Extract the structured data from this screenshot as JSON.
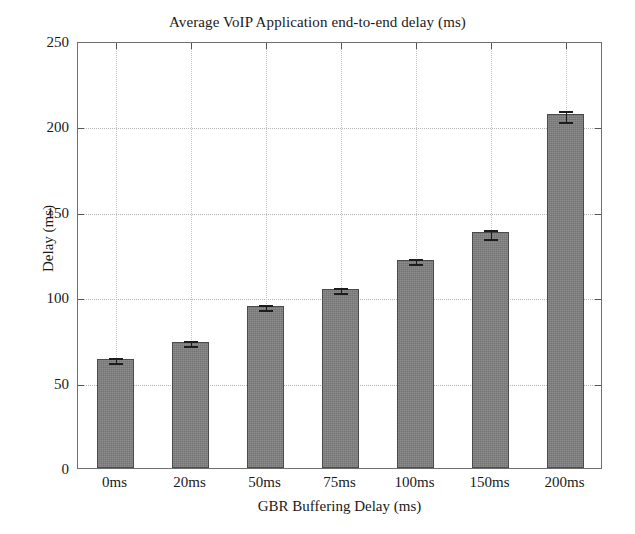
{
  "chart_data": {
    "type": "bar",
    "title": "Average VoIP Application end-to-end delay (ms)",
    "xlabel": "GBR Buffering Delay (ms)",
    "ylabel": "Delay (ms)",
    "categories": [
      "0ms",
      "20ms",
      "50ms",
      "75ms",
      "100ms",
      "150ms",
      "200ms"
    ],
    "values": [
      64,
      74,
      95,
      105,
      122,
      138,
      207
    ],
    "errors": [
      1.5,
      1.5,
      1.5,
      1.5,
      1.5,
      2.5,
      3.0
    ],
    "ylim": [
      0,
      250
    ],
    "yticks": [
      0,
      50,
      100,
      150,
      200,
      250
    ],
    "ytick_labels": [
      "0",
      "50",
      "100",
      "150",
      "200",
      "250"
    ],
    "grid": true,
    "legend": null,
    "series_color": "#808080",
    "bar_edge_color": "#4a4a4a",
    "grid_color": "#b5b5b5",
    "axis_color": "#6f6f6f",
    "text_color": "#1a1a1a"
  }
}
